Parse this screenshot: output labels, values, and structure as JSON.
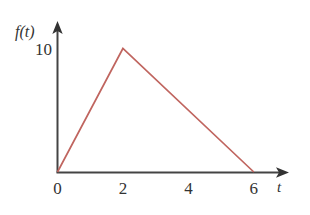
{
  "chart_data": {
    "type": "line",
    "title": "",
    "subtitle": "",
    "xlabel": "t",
    "ylabel": "f(t)",
    "x": [
      0,
      2,
      6
    ],
    "values": [
      0,
      10,
      0
    ],
    "series": [
      {
        "name": "f(t)",
        "x": [
          0,
          2,
          6
        ],
        "values": [
          0,
          10,
          0
        ],
        "color": "#c0655f"
      }
    ],
    "xticks": [
      "0",
      "2",
      "4",
      "6"
    ],
    "xtick_values": [
      0,
      2,
      4,
      6
    ],
    "yticks": [
      "10"
    ],
    "ytick_values": [
      10
    ],
    "xlim": [
      0,
      6.8
    ],
    "ylim": [
      0,
      11.5
    ],
    "grid": false,
    "legend": false,
    "legend_position": "none",
    "annotations": [],
    "axis_color": "#444444",
    "axis_arrows": [
      "x-axis-arrow",
      "y-axis-arrow"
    ],
    "background_color": "#ffffff"
  },
  "axes": {
    "y_axis_label": "f(t)",
    "x_axis_label": "t",
    "y_tick_10": "10",
    "x_tick_0": "0",
    "x_tick_2": "2",
    "x_tick_4": "4",
    "x_tick_6": "6"
  }
}
